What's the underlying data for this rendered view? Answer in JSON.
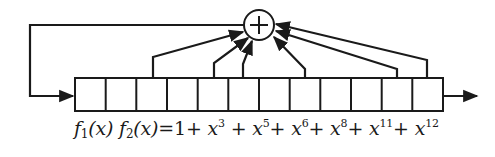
{
  "diagram": {
    "type": "LFSR",
    "register": {
      "cell_count": 12,
      "tap_positions": [
        3,
        5,
        6,
        8,
        11,
        12
      ]
    },
    "xor_symbol": "+",
    "formula": {
      "lhs_f1": "f",
      "lhs_f1_sub": "1",
      "lhs_x1": "(x)",
      "lhs_f2": "f",
      "lhs_f2_sub": "2",
      "lhs_x2": "(x)",
      "equals": "=",
      "constant": "1",
      "terms": [
        {
          "base": "x",
          "exp": "3"
        },
        {
          "base": "x",
          "exp": "5"
        },
        {
          "base": "x",
          "exp": "6"
        },
        {
          "base": "x",
          "exp": "8"
        },
        {
          "base": "x",
          "exp": "11"
        },
        {
          "base": "x",
          "exp": "12"
        }
      ],
      "plus": "+"
    },
    "colors": {
      "stroke": "#1a1a1a",
      "background": "#ffffff"
    }
  }
}
